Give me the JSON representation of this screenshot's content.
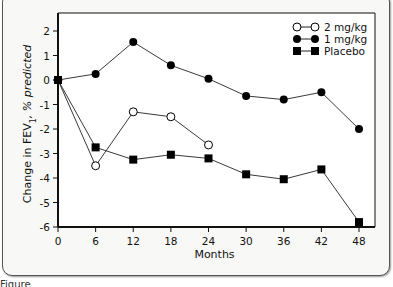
{
  "chart_data": {
    "type": "line",
    "title": "",
    "xlabel": "Months",
    "ylabel": "Change in FEV1, % predicted",
    "ylabel_parts": {
      "pre": "Change in FEV",
      "sub": "1",
      "post": ", % predicted"
    },
    "x_ticks": [
      0,
      6,
      12,
      18,
      24,
      30,
      36,
      42,
      48
    ],
    "y_ticks": [
      2,
      1,
      0,
      -1,
      -2,
      -3,
      -4,
      -5,
      -6
    ],
    "xlim": [
      0,
      48
    ],
    "ylim": [
      -6,
      2.6
    ],
    "grid": false,
    "legend_position": "top-right",
    "series": [
      {
        "name": "2 mg/kg",
        "marker": "open-circle",
        "x": [
          0,
          6,
          12,
          18,
          24
        ],
        "values": [
          0,
          -3.5,
          -1.3,
          -1.5,
          -2.65
        ]
      },
      {
        "name": "1 mg/kg",
        "marker": "filled-circle",
        "x": [
          0,
          6,
          12,
          18,
          24,
          30,
          36,
          42,
          48
        ],
        "values": [
          0,
          0.25,
          1.55,
          0.6,
          0.05,
          -0.65,
          -0.8,
          -0.5,
          -2.0
        ]
      },
      {
        "name": "Placebo",
        "marker": "filled-square",
        "x": [
          0,
          6,
          12,
          18,
          24,
          30,
          36,
          42,
          48
        ],
        "values": [
          0,
          -2.75,
          -3.25,
          -3.05,
          -3.2,
          -3.85,
          -4.05,
          -3.65,
          -5.8
        ]
      }
    ]
  },
  "caption": "Figure"
}
